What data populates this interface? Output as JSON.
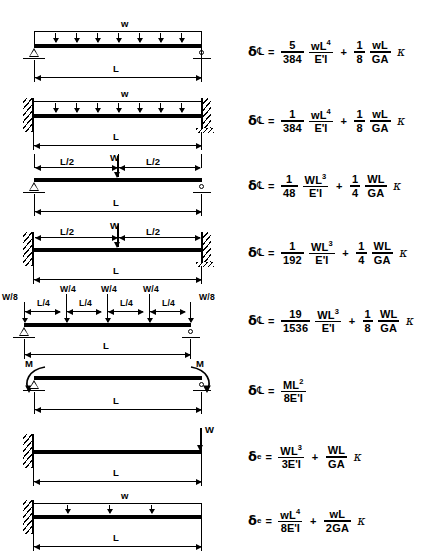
{
  "doc": {
    "title": "Beam Deflection Formulas",
    "symbols": {
      "delta": "δ",
      "sub_centerline": "℄",
      "sub_end": "e",
      "kappa": "κ",
      "equals": "="
    }
  },
  "rows": [
    {
      "id": "simply-supported-uniform-load",
      "support_left": "pin",
      "support_right": "roller",
      "load_type": "uniform-distributed",
      "load_label": "w",
      "dimension_labels": [
        "L"
      ],
      "formula": {
        "lhs_symbol": "δ",
        "lhs_subscript": "℄",
        "terms": [
          {
            "coef_num": "5",
            "coef_den": "384",
            "var_num": "wL",
            "var_num_exp": "4",
            "var_den": "E'I"
          },
          {
            "coef_num": "1",
            "coef_den": "8",
            "var_num": "wL",
            "var_num_exp": "",
            "var_den": "GA",
            "kappa": "κ"
          }
        ]
      }
    },
    {
      "id": "fixed-fixed-uniform-load",
      "support_left": "fixed",
      "support_right": "fixed",
      "load_type": "uniform-distributed",
      "load_label": "w",
      "dimension_labels": [
        "L"
      ],
      "formula": {
        "lhs_symbol": "δ",
        "lhs_subscript": "℄",
        "terms": [
          {
            "coef_num": "1",
            "coef_den": "384",
            "var_num": "wL",
            "var_num_exp": "4",
            "var_den": "E'I"
          },
          {
            "coef_num": "1",
            "coef_den": "8",
            "var_num": "wL",
            "var_num_exp": "",
            "var_den": "GA",
            "kappa": "κ"
          }
        ]
      }
    },
    {
      "id": "simply-supported-center-point-load",
      "support_left": "pin",
      "support_right": "roller",
      "load_type": "center-point",
      "load_label": "W",
      "dimension_labels": [
        "L/2",
        "L/2",
        "L"
      ],
      "formula": {
        "lhs_symbol": "δ",
        "lhs_subscript": "℄",
        "terms": [
          {
            "coef_num": "1",
            "coef_den": "48",
            "var_num": "WL",
            "var_num_exp": "3",
            "var_den": "E'I"
          },
          {
            "coef_num": "1",
            "coef_den": "4",
            "var_num": "WL",
            "var_num_exp": "",
            "var_den": "GA",
            "kappa": "κ"
          }
        ]
      }
    },
    {
      "id": "fixed-fixed-center-point-load",
      "support_left": "fixed",
      "support_right": "fixed",
      "load_type": "center-point",
      "load_label": "W",
      "dimension_labels": [
        "L/2",
        "L/2",
        "L"
      ],
      "formula": {
        "lhs_symbol": "δ",
        "lhs_subscript": "℄",
        "terms": [
          {
            "coef_num": "1",
            "coef_den": "192",
            "var_num": "WL",
            "var_num_exp": "3",
            "var_den": "E'I"
          },
          {
            "coef_num": "1",
            "coef_den": "4",
            "var_num": "WL",
            "var_num_exp": "",
            "var_den": "GA",
            "kappa": "κ"
          }
        ]
      }
    },
    {
      "id": "simply-supported-five-point-loads",
      "support_left": "pin",
      "support_right": "roller",
      "load_type": "five-point",
      "load_labels": [
        "W/8",
        "W/4",
        "W/4",
        "W/4",
        "W/8"
      ],
      "dimension_labels": [
        "L/4",
        "L/4",
        "L/4",
        "L/4",
        "L"
      ],
      "formula": {
        "lhs_symbol": "δ",
        "lhs_subscript": "℄",
        "terms": [
          {
            "coef_num": "19",
            "coef_den": "1536",
            "var_num": "WL",
            "var_num_exp": "3",
            "var_den": "E'I"
          },
          {
            "coef_num": "1",
            "coef_den": "8",
            "var_num": "WL",
            "var_num_exp": "",
            "var_den": "GA",
            "kappa": "κ"
          }
        ]
      }
    },
    {
      "id": "simply-supported-end-moments",
      "support_left": "pin",
      "support_right": "roller",
      "load_type": "end-moments",
      "load_labels": [
        "M",
        "M"
      ],
      "dimension_labels": [
        "L"
      ],
      "formula": {
        "lhs_symbol": "δ",
        "lhs_subscript": "℄",
        "terms": [
          {
            "coef_num": "ML",
            "coef_num_exp": "2",
            "coef_den": "8E'I"
          }
        ]
      }
    },
    {
      "id": "cantilever-end-point-load",
      "support_left": "fixed",
      "support_right": "free",
      "load_type": "end-point",
      "load_label": "W",
      "dimension_labels": [
        "L"
      ],
      "formula": {
        "lhs_symbol": "δ",
        "lhs_subscript": "e",
        "terms": [
          {
            "coef_num": "WL",
            "coef_num_exp": "3",
            "coef_den": "3E'I"
          },
          {
            "coef_num": "WL",
            "coef_num_exp": "",
            "coef_den": "GA",
            "kappa": "κ"
          }
        ]
      }
    },
    {
      "id": "cantilever-uniform-load",
      "support_left": "fixed",
      "support_right": "free",
      "load_type": "uniform-distributed",
      "load_label": "w",
      "dimension_labels": [
        "L"
      ],
      "formula": {
        "lhs_symbol": "δ",
        "lhs_subscript": "e",
        "terms": [
          {
            "coef_num": "wL",
            "coef_num_exp": "4",
            "coef_den": "8E'I"
          },
          {
            "coef_num": "wL",
            "coef_num_exp": "",
            "coef_den": "2GA",
            "kappa": "κ"
          }
        ]
      }
    }
  ]
}
